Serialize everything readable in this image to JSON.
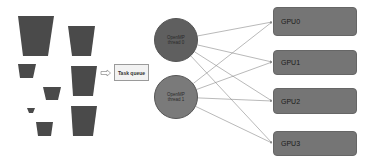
{
  "colors": {
    "task_fill": "#4a4a4a",
    "thread0_fill": "#5f5f5f",
    "thread1_fill": "#7a7a7a",
    "gpu_fill": "#757575",
    "edge": "#8a8a8a"
  },
  "tasks": [
    {
      "id": "task-1",
      "top": [
        18,
        54
      ],
      "bottom": [
        23,
        48
      ],
      "y": [
        16,
        56
      ]
    },
    {
      "id": "task-2",
      "top": [
        68,
        95
      ],
      "bottom": [
        72,
        91
      ],
      "y": [
        26,
        56
      ]
    },
    {
      "id": "task-3",
      "top": [
        18,
        36
      ],
      "bottom": [
        20,
        33
      ],
      "y": [
        64,
        78
      ]
    },
    {
      "id": "task-4",
      "top": [
        71,
        97
      ],
      "bottom": [
        73,
        93
      ],
      "y": [
        66,
        96
      ]
    },
    {
      "id": "task-5",
      "top": [
        43,
        61
      ],
      "bottom": [
        46,
        58
      ],
      "y": [
        87,
        100
      ]
    },
    {
      "id": "task-6",
      "top": [
        27,
        35
      ],
      "bottom": [
        29,
        33
      ],
      "y": [
        108,
        113
      ]
    },
    {
      "id": "task-7",
      "top": [
        71,
        97
      ],
      "bottom": [
        73,
        93
      ],
      "y": [
        106,
        136
      ]
    },
    {
      "id": "task-8",
      "top": [
        36,
        53
      ],
      "bottom": [
        38,
        51
      ],
      "y": [
        122,
        136
      ]
    }
  ],
  "task_queue": {
    "label": "Task queue"
  },
  "threads": [
    {
      "line1": "OpenMP",
      "line2": "thread 0",
      "cx": 176,
      "cy": 40
    },
    {
      "line1": "OpenMP",
      "line2": "thread 1",
      "cx": 176,
      "cy": 97
    }
  ],
  "gpus": [
    {
      "label": "GPU0",
      "top": 7,
      "height": 29,
      "anchor_y": 22
    },
    {
      "label": "GPU1",
      "top": 50,
      "height": 25,
      "anchor_y": 62
    },
    {
      "label": "GPU2",
      "top": 88,
      "height": 26,
      "anchor_y": 101
    },
    {
      "label": "GPU3",
      "top": 131,
      "height": 25,
      "anchor_y": 143
    }
  ],
  "edges": [
    {
      "from": "thread 0",
      "to": "GPU0"
    },
    {
      "from": "thread 0",
      "to": "GPU1"
    },
    {
      "from": "thread 0",
      "to": "GPU2"
    },
    {
      "from": "thread 0",
      "to": "GPU3"
    },
    {
      "from": "thread 1",
      "to": "GPU0"
    },
    {
      "from": "thread 1",
      "to": "GPU1"
    },
    {
      "from": "thread 1",
      "to": "GPU2"
    },
    {
      "from": "thread 1",
      "to": "GPU3"
    }
  ]
}
